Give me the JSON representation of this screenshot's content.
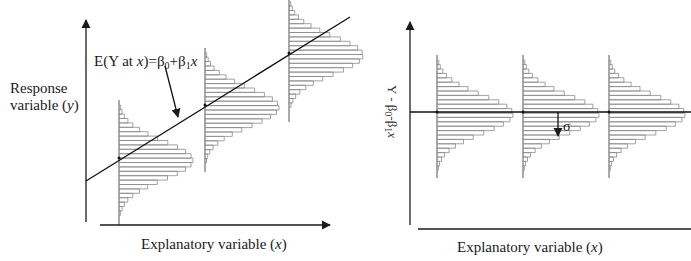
{
  "left_panel": {
    "y_label_line1": "Response",
    "y_label_line2_prefix": "variable (",
    "y_label_var": "y",
    "y_label_suffix": ")",
    "x_label_prefix": "Explanatory variable (",
    "x_label_var": "x",
    "x_label_suffix": ")",
    "equation": {
      "lhs_prefix": "E(Y at ",
      "lhs_var": "x",
      "lhs_suffix": ")=β",
      "sub0": "0",
      "plus_beta": "+β",
      "sub1": "1",
      "rhs_var": "x"
    },
    "regression_line": {
      "x1": 86,
      "y1": 181,
      "x2": 350,
      "y2": 17
    },
    "distributions": [
      {
        "base_x": 119,
        "mean_y": 158,
        "top_y": 100,
        "bottom_y": 225
      },
      {
        "base_x": 205,
        "mean_y": 105,
        "top_y": 48,
        "bottom_y": 172
      },
      {
        "base_x": 289,
        "mean_y": 53,
        "top_y": 0,
        "bottom_y": 122
      }
    ]
  },
  "right_panel": {
    "y_label_prefix": "Y - β",
    "y_sub0": "0",
    "y_mid": "-β",
    "y_sub1": "1",
    "y_var": "x",
    "x_label_prefix": "Explanatory variable (",
    "x_label_var": "x",
    "x_label_suffix": ")",
    "sigma_label": "σ",
    "zero_line_y": 112,
    "distributions": [
      {
        "base_x": 437,
        "mean_y": 112,
        "top_y": 55,
        "bottom_y": 178
      },
      {
        "base_x": 523,
        "mean_y": 112,
        "top_y": 55,
        "bottom_y": 178
      },
      {
        "base_x": 609,
        "mean_y": 112,
        "top_y": 55,
        "bottom_y": 178
      }
    ]
  },
  "colors": {
    "axis": "#1a1a1a",
    "bars": "#8a8a8a",
    "line": "#111111"
  }
}
